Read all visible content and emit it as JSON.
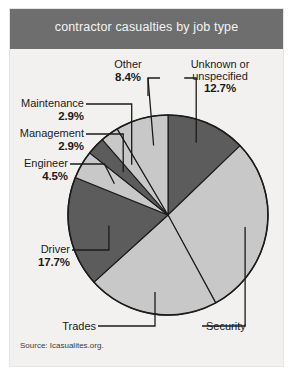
{
  "figure": {
    "title": "contractor casualties by job type",
    "source": "Source: Icasualites.org."
  },
  "colors": {
    "title_band": "#6e6e6e",
    "panel_background": "#f2f1ef",
    "page_background": "#ffffff",
    "slice_dark": "#5c5c5c",
    "slice_light": "#c8c8c8",
    "outline": "#1b1b1b",
    "label_text": "#1b1b1b"
  },
  "labels": {
    "other": {
      "name": "Other",
      "percent": "8.4%"
    },
    "unknown": {
      "name_line1": "Unknown or",
      "name_line2": "unspecified",
      "percent": "12.7%"
    },
    "maintenance": {
      "name": "Maintenance",
      "percent": "2.9%"
    },
    "management": {
      "name": "Management",
      "percent": "2.9%"
    },
    "engineer": {
      "name": "Engineer",
      "percent": "4.5%"
    },
    "driver": {
      "name": "Driver",
      "percent": "17.7%"
    },
    "trades": {
      "name": "Trades",
      "percent": ""
    },
    "security": {
      "name": "Security",
      "percent": ""
    }
  },
  "chart_data": {
    "type": "pie",
    "title": "contractor casualties by job type",
    "source": "Source: Icasualites.org.",
    "legend": "none - direct labels with leader lines",
    "start_angle_deg": 0,
    "direction": "clockwise from 12 o'clock",
    "units": "percent",
    "categories": [
      "Unknown or unspecified",
      "Security",
      "Trades",
      "Driver",
      "Engineer",
      "Management",
      "Maintenance",
      "Other"
    ],
    "values": [
      12.7,
      29.0,
      21.0,
      17.7,
      4.5,
      2.9,
      2.9,
      8.4
    ],
    "labeled_values": [
      {
        "label": "Unknown or unspecified",
        "percent": 12.7,
        "display": "12.7%",
        "color": "#5c5c5c"
      },
      {
        "label": "Security",
        "percent": 29.0,
        "display": "",
        "color": "#c8c8c8"
      },
      {
        "label": "Trades",
        "percent": 21.0,
        "display": "",
        "color": "#c8c8c8"
      },
      {
        "label": "Driver",
        "percent": 17.7,
        "display": "17.7%",
        "color": "#5c5c5c"
      },
      {
        "label": "Engineer",
        "percent": 4.5,
        "display": "4.5%",
        "color": "#c8c8c8"
      },
      {
        "label": "Management",
        "percent": 2.9,
        "display": "2.9%",
        "color": "#5c5c5c"
      },
      {
        "label": "Maintenance",
        "percent": 2.9,
        "display": "2.9%",
        "color": "#c8c8c8"
      },
      {
        "label": "Other",
        "percent": 8.4,
        "display": "8.4%",
        "color": "#c8c8c8"
      }
    ]
  }
}
